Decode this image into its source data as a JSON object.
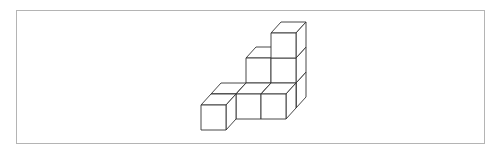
{
  "figure": {
    "stroke_color": "#333333",
    "frame_color": "#b4b4b4",
    "cube_size": 25,
    "depth_dx": 10,
    "depth_dy": -11,
    "cubes": [
      {
        "col": 0,
        "row": 0,
        "layer": 0
      },
      {
        "col": 0,
        "row": 1,
        "layer": 0
      },
      {
        "col": 1,
        "row": 1,
        "layer": 0
      },
      {
        "col": 2,
        "row": 1,
        "layer": 0
      },
      {
        "col": 1,
        "row": 2,
        "layer": 0
      },
      {
        "col": 1,
        "row": 2,
        "layer": 1
      },
      {
        "col": 2,
        "row": 2,
        "layer": 0
      },
      {
        "col": 2,
        "row": 2,
        "layer": 1
      },
      {
        "col": 2,
        "row": 2,
        "layer": 2
      }
    ]
  }
}
